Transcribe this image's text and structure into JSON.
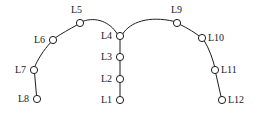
{
  "diagram": {
    "type": "node-link-graph",
    "shape": "inverted-v-arch",
    "background_color": "#ffffff",
    "stroke_color": "#1d1d1d",
    "node_fill_color": "#ffffff",
    "label_color": "#1a1a1a",
    "node_radius": 3.6,
    "nodes": [
      {
        "id": "L1",
        "label": "L1",
        "cx": 120,
        "cy": 100,
        "label_x": 101,
        "label_y": 95,
        "label_side": "left"
      },
      {
        "id": "L2",
        "label": "L2",
        "cx": 120,
        "cy": 79,
        "label_x": 101,
        "label_y": 74,
        "label_side": "left"
      },
      {
        "id": "L3",
        "label": "L3",
        "cx": 120,
        "cy": 57,
        "label_x": 101,
        "label_y": 52,
        "label_side": "left"
      },
      {
        "id": "L4",
        "label": "L4",
        "cx": 120,
        "cy": 36,
        "label_x": 101,
        "label_y": 31,
        "label_side": "left"
      },
      {
        "id": "L5",
        "label": "L5",
        "cx": 80,
        "cy": 23,
        "label_x": 71,
        "label_y": 5,
        "label_side": "above"
      },
      {
        "id": "L6",
        "label": "L6",
        "cx": 53,
        "cy": 40,
        "label_x": 34,
        "label_y": 35,
        "label_side": "left"
      },
      {
        "id": "L7",
        "label": "L7",
        "cx": 34,
        "cy": 70,
        "label_x": 15,
        "label_y": 65,
        "label_side": "left"
      },
      {
        "id": "L8",
        "label": "L8",
        "cx": 37,
        "cy": 99,
        "label_x": 18,
        "label_y": 94,
        "label_side": "left"
      },
      {
        "id": "L9",
        "label": "L9",
        "cx": 177,
        "cy": 23,
        "label_x": 171,
        "label_y": 5,
        "label_side": "above"
      },
      {
        "id": "L10",
        "label": "L10",
        "cx": 202,
        "cy": 38,
        "label_x": 208,
        "label_y": 33,
        "label_side": "right"
      },
      {
        "id": "L11",
        "label": "L11",
        "cx": 215,
        "cy": 70,
        "label_x": 221,
        "label_y": 65,
        "label_side": "right"
      },
      {
        "id": "L12",
        "label": "L12",
        "cx": 222,
        "cy": 100,
        "label_x": 228,
        "label_y": 95,
        "label_side": "right"
      }
    ],
    "edges": [
      {
        "from": "L1",
        "to": "L2",
        "path": "M 120 96.4 L 120 82.6"
      },
      {
        "from": "L2",
        "to": "L3",
        "path": "M 120 75.4 L 120 60.6"
      },
      {
        "from": "L3",
        "to": "L4",
        "path": "M 120 53.4 L 120 39.6"
      },
      {
        "from": "L4",
        "to": "L5",
        "path": "M 117.2 33.8 C 110 22 96 16.5 83.2 21.2"
      },
      {
        "from": "L5",
        "to": "L6",
        "path": "M 77.1 24.9 C 69 29.5 61.5 33.5 55.6 37.6"
      },
      {
        "from": "L6",
        "to": "L7",
        "path": "M 50.6 42.6 C 43.5 50 37.5 60 34.8 66.5"
      },
      {
        "from": "L7",
        "to": "L8",
        "path": "M 34.6 73.6 L 36.5 95.4"
      },
      {
        "from": "L4",
        "to": "L9",
        "path": "M 122.8 33.8 C 130 22 149 15.5 173.6 21.3"
      },
      {
        "from": "L9",
        "to": "L10",
        "path": "M 180.3 24.6 C 188 28.5 195.5 33 199.5 36.3"
      },
      {
        "from": "L10",
        "to": "L11",
        "path": "M 204.4 41 C 209 48 213 60 214.6 66.5"
      },
      {
        "from": "L11",
        "to": "L12",
        "path": "M 215.8 73.5 L 221 96.5"
      }
    ]
  }
}
